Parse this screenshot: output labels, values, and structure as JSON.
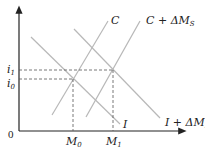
{
  "diagram": {
    "type": "IS-LM style money market diagram",
    "axes": {
      "origin_label": "0",
      "y_ticks": [
        {
          "label": "i",
          "sub": "1",
          "y": 70
        },
        {
          "label": "i",
          "sub": "0",
          "y": 79
        }
      ],
      "x_ticks": [
        {
          "label": "M",
          "sub": "0",
          "x": 73
        },
        {
          "label": "M",
          "sub": "1",
          "x": 113
        }
      ]
    },
    "curves": [
      {
        "name": "C",
        "label": "C",
        "from": [
          52,
          115
        ],
        "to": [
          108,
          21
        ]
      },
      {
        "name": "C_shifted",
        "label": "C + ΔM",
        "sub": "S",
        "from": [
          86,
          117
        ],
        "to": [
          140,
          21
        ]
      },
      {
        "name": "I",
        "label": "I",
        "from": [
          31,
          37
        ],
        "to": [
          120,
          124
        ]
      },
      {
        "name": "I_shifted",
        "label": "I + ΔM",
        "sub": "D",
        "from": [
          74,
          29
        ],
        "to": [
          160,
          118
        ]
      }
    ],
    "colors": {
      "axis": "#222222",
      "curve": "#b8b8b8",
      "dash": "#555555"
    }
  }
}
